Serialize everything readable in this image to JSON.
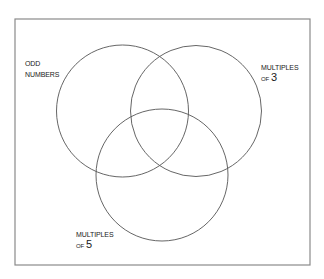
{
  "diagram": {
    "type": "venn",
    "frame": {
      "x": 15,
      "y": 19,
      "width": 295,
      "height": 246,
      "stroke": "#8a8a8a"
    },
    "circles": [
      {
        "id": "odd",
        "cx": 122.5,
        "cy": 111,
        "r": 66,
        "stroke": "#555555"
      },
      {
        "id": "mult3",
        "cx": 196,
        "cy": 111,
        "r": 65.5,
        "stroke": "#555555"
      },
      {
        "id": "mult5",
        "cx": 162,
        "cy": 175,
        "r": 66,
        "stroke": "#555555"
      }
    ],
    "labels": {
      "odd": {
        "line1": "ODD",
        "line2": "NUMBERS"
      },
      "mult3": {
        "line1": "MULTIPLES",
        "prefix": "OF",
        "number": "3"
      },
      "mult5": {
        "line1": "MULTIPLES",
        "prefix": "OF",
        "number": "5"
      }
    }
  }
}
